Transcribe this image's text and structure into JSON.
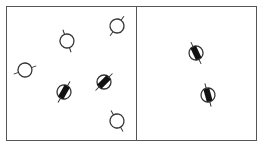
{
  "diagram": {
    "panels": [
      {
        "name": "left",
        "symbols": [
          {
            "type": "open",
            "x": 67,
            "y": 41,
            "angle": -20
          },
          {
            "type": "open",
            "x": 117,
            "y": 26,
            "angle": 35
          },
          {
            "type": "open",
            "x": 25,
            "y": 70,
            "angle": 70
          },
          {
            "type": "filled",
            "x": 64,
            "y": 92,
            "angle": 30
          },
          {
            "type": "filled",
            "x": 104,
            "y": 82,
            "angle": 45
          },
          {
            "type": "open",
            "x": 117,
            "y": 121,
            "angle": -30
          }
        ]
      },
      {
        "name": "right",
        "symbols": [
          {
            "type": "filled",
            "x": 196,
            "y": 53,
            "angle": -25
          },
          {
            "type": "filled",
            "x": 208,
            "y": 95,
            "angle": -15
          }
        ]
      }
    ],
    "colors": {
      "stroke": "#333333",
      "fill": "#111111",
      "frame": "#555555"
    }
  }
}
